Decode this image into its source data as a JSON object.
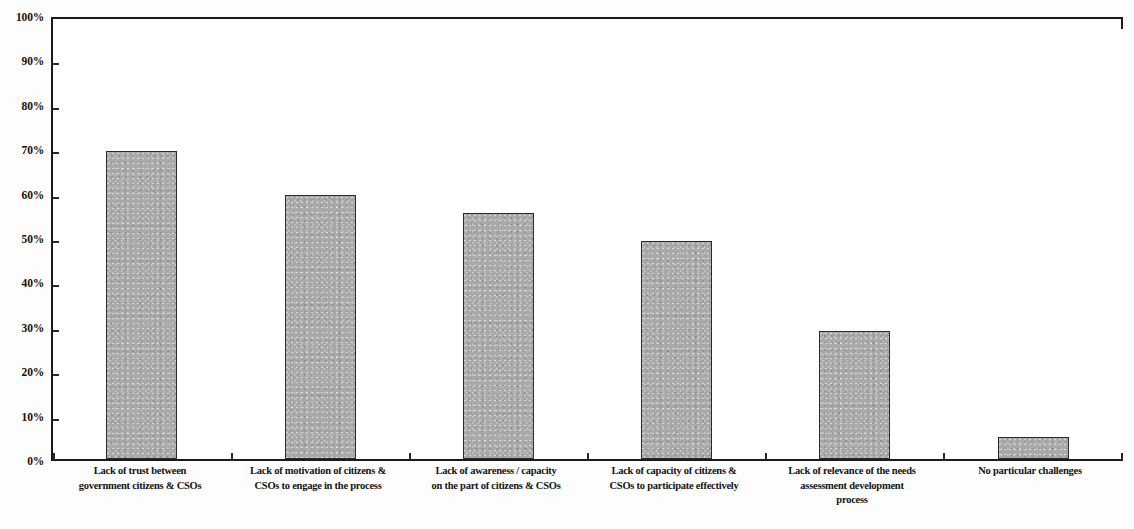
{
  "chart_data": {
    "type": "bar",
    "title": "",
    "subtitle": "",
    "xlabel": "",
    "ylabel": "",
    "ylim": [
      0,
      100
    ],
    "grid": false,
    "legend": "none",
    "y_tick_labels": [
      "100%",
      "90%",
      "80%",
      "70%",
      "60%",
      "50%",
      "40%",
      "30%",
      "20%",
      "10%",
      "0%"
    ],
    "y_tick_values": [
      100,
      90,
      80,
      70,
      60,
      50,
      40,
      30,
      20,
      10,
      0
    ],
    "categories": [
      "Lack of trust between government citizens & CSOs",
      "Lack of motivation of citizens & CSOs to engage in the process",
      "Lack of awareness / capacity on the part of citizens & CSOs",
      "Lack of capacity of citizens & CSOs to participate effectively",
      "Lack of relevance of the needs assessment development process",
      "No particular challenges"
    ],
    "category_lines": [
      [
        "Lack of trust between",
        "government citizens & CSOs"
      ],
      [
        "Lack of motivation of citizens &",
        "CSOs to engage in the process"
      ],
      [
        "Lack of awareness / capacity",
        "on the part of citizens & CSOs"
      ],
      [
        "Lack of capacity of citizens &",
        "CSOs to participate effectively"
      ],
      [
        "Lack of relevance of the needs",
        "assessment development",
        "process"
      ],
      [
        "No particular challenges"
      ]
    ],
    "values": [
      70,
      60,
      56,
      49.5,
      29,
      5
    ],
    "value_labels": [
      "70%",
      "60%",
      "56%",
      "49.5%",
      "29%",
      "5%"
    ],
    "series": [
      {
        "name": "Share of respondents",
        "values": [
          70,
          60,
          56,
          49.5,
          29,
          5
        ]
      }
    ],
    "colors": {
      "bar_fill": "#a9a9a9",
      "bar_border": "#2b2b2b",
      "axis": "#1a1a1a",
      "text": "#141414",
      "background": "#ffffff"
    }
  }
}
